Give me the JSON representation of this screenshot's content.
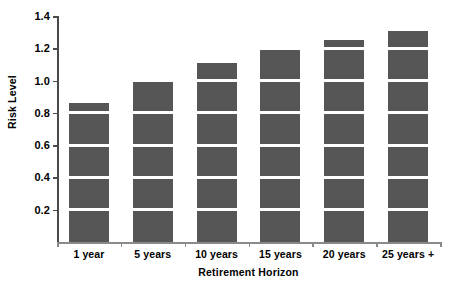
{
  "chart_data": {
    "type": "bar",
    "title": "",
    "subtitle": "",
    "xlabel": "Retirement Horizon",
    "ylabel": "Risk Level",
    "categories": [
      "1 year",
      "5 years",
      "10 years",
      "15 years",
      "20 years",
      "25 years +"
    ],
    "values": [
      0.86,
      0.99,
      1.11,
      1.19,
      1.25,
      1.31
    ],
    "series": [
      {
        "name": "Risk Level",
        "values": [
          0.86,
          0.99,
          1.11,
          1.19,
          1.25,
          1.31
        ]
      }
    ],
    "ylim": [
      0,
      1.4
    ],
    "ytick_values": [
      0.2,
      0.4,
      0.6,
      0.8,
      1.0,
      1.2,
      1.4
    ],
    "ytick_labels": [
      "0.2",
      "0.4",
      "0.6",
      "0.8",
      "1.0",
      "1.2",
      "1.4"
    ],
    "grid": false,
    "legend": false,
    "legend_position": "none",
    "bar_color": "#565656",
    "axis_color": "#4a4a4a",
    "separator_color": "#ffffff",
    "segment_interval": 0.2,
    "background_color": "#ffffff",
    "annotations": []
  }
}
